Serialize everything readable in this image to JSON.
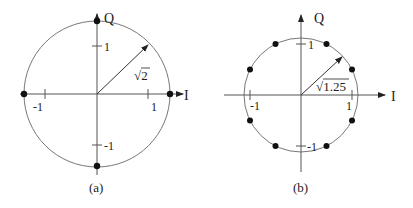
{
  "figure": {
    "panels": [
      {
        "caption": "(a)",
        "title": "QPSK-like constellation on circle of radius sqrt(2)",
        "axes": {
          "x_label": "I",
          "y_label": "Q",
          "x_ticks": [
            "-1",
            "1"
          ],
          "y_ticks": [
            "1",
            "-1"
          ]
        },
        "radius_label": "√2",
        "radius_value": "sqrt(2)",
        "points": [
          [
            1.414,
            0
          ],
          [
            -1.414,
            0
          ],
          [
            0,
            1.414
          ],
          [
            0,
            -1.414
          ]
        ]
      },
      {
        "caption": "(b)",
        "title": "8-point constellation on circle of radius sqrt(1.25)",
        "axes": {
          "x_label": "I",
          "y_label": "Q",
          "x_ticks": [
            "-1",
            "1"
          ],
          "y_ticks": [
            "1",
            "-1"
          ]
        },
        "radius_label": "√1.25",
        "radius_value": "sqrt(1.25)",
        "points": [
          [
            0.5,
            1
          ],
          [
            -0.5,
            1
          ],
          [
            1,
            0.5
          ],
          [
            -1,
            0.5
          ],
          [
            1,
            -0.5
          ],
          [
            -1,
            -0.5
          ],
          [
            0.5,
            -1
          ],
          [
            -0.5,
            -1
          ]
        ]
      }
    ],
    "colors": {
      "axis": "#555555",
      "circle": "#777777",
      "point": "#111111"
    }
  }
}
